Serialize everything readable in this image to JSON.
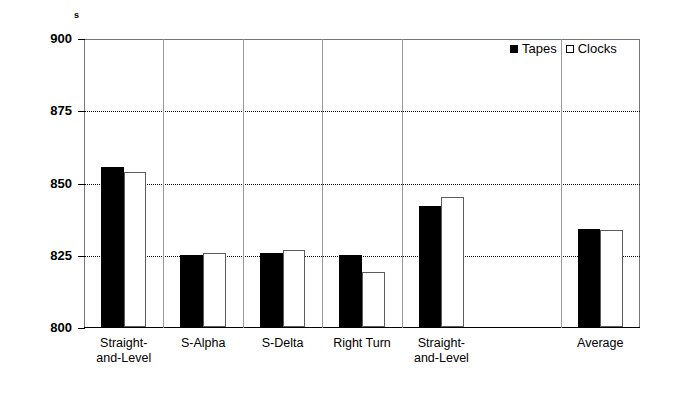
{
  "chart_data": {
    "type": "bar",
    "title": "",
    "xlabel": "",
    "ylabel": "s",
    "unit_label": "s",
    "ylim": [
      800,
      900
    ],
    "ytick_values": [
      800,
      825,
      850,
      875,
      900
    ],
    "ytick_labels": [
      "800",
      "825",
      "850",
      "875",
      "900"
    ],
    "grid": "horizontal-dotted",
    "gridline_values": [
      825,
      850,
      875
    ],
    "legend_position": "top-right",
    "categories": [
      "Straight-and-Level",
      "S-Alpha",
      "S-Delta",
      "Right Turn",
      "Straight-and-Level",
      "Average"
    ],
    "category_lines": [
      [
        "Straight-",
        "and-Level"
      ],
      [
        "S-Alpha",
        ""
      ],
      [
        "S-Delta",
        ""
      ],
      [
        "Right Turn",
        ""
      ],
      [
        "Straight-",
        "and-Level"
      ],
      [
        "Average",
        ""
      ]
    ],
    "series": [
      {
        "name": "Tapes",
        "values": [
          855.5,
          825.0,
          825.5,
          825.0,
          842.0,
          834.0
        ]
      },
      {
        "name": "Clocks",
        "values": [
          853.5,
          825.5,
          826.5,
          819.0,
          845.0,
          833.5
        ]
      }
    ]
  },
  "legend": {
    "items": [
      {
        "label": "Tapes",
        "marker": "filled-square"
      },
      {
        "label": "Clocks",
        "marker": "open-square"
      }
    ]
  },
  "colors": {
    "tapes_fill": "#000000",
    "clocks_fill": "#ffffff",
    "clocks_border": "#5c5c5c",
    "axis": "#000000",
    "grid": "#000000",
    "background": "#ffffff"
  }
}
